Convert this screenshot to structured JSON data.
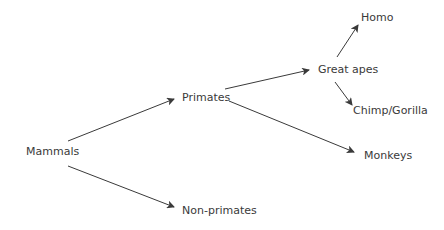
{
  "diagram": {
    "type": "tree",
    "colors": {
      "text": "#3a3a3a",
      "edge": "#3a3a3a",
      "background": "#ffffff"
    },
    "nodes": {
      "mammals": "Mammals",
      "primates": "Primates",
      "non_primates": "Non-primates",
      "great_apes": "Great apes",
      "monkeys": "Monkeys",
      "homo": "Homo",
      "chimp_gorilla": "Chimp/Gorilla"
    },
    "edges": [
      {
        "from": "Mammals",
        "to": "Primates"
      },
      {
        "from": "Mammals",
        "to": "Non-primates"
      },
      {
        "from": "Primates",
        "to": "Great apes"
      },
      {
        "from": "Primates",
        "to": "Monkeys"
      },
      {
        "from": "Great apes",
        "to": "Homo"
      },
      {
        "from": "Great apes",
        "to": "Chimp/Gorilla"
      }
    ]
  }
}
